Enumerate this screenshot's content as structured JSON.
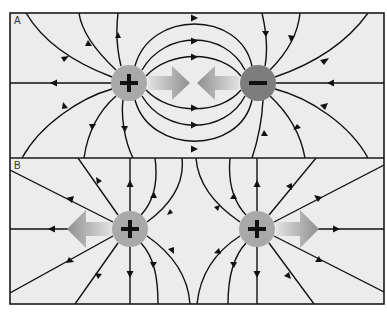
{
  "figure": {
    "colors": {
      "background": "#ececec",
      "line": "#111111",
      "positive_charge": "#a9a9a9",
      "negative_charge": "#7d7d7d",
      "force_arrow": "#9a9a9a"
    }
  },
  "panels": [
    {
      "label": "A",
      "description": "Opposite charges attract",
      "charges": [
        {
          "sign": "+",
          "x": 129,
          "y": 83
        },
        {
          "sign": "−",
          "x": 258,
          "y": 83
        }
      ],
      "force_arrows": [
        {
          "direction": "right",
          "from": 148,
          "to": 190,
          "y": 83
        },
        {
          "direction": "left",
          "from": 239,
          "to": 197,
          "y": 83
        }
      ]
    },
    {
      "label": "B",
      "description": "Like charges repel",
      "charges": [
        {
          "sign": "+",
          "x": 130,
          "y": 229
        },
        {
          "sign": "+",
          "x": 257,
          "y": 229
        }
      ],
      "force_arrows": [
        {
          "direction": "left",
          "from": 112,
          "to": 67,
          "y": 229
        },
        {
          "direction": "right",
          "from": 276,
          "to": 319,
          "y": 229
        }
      ]
    }
  ]
}
